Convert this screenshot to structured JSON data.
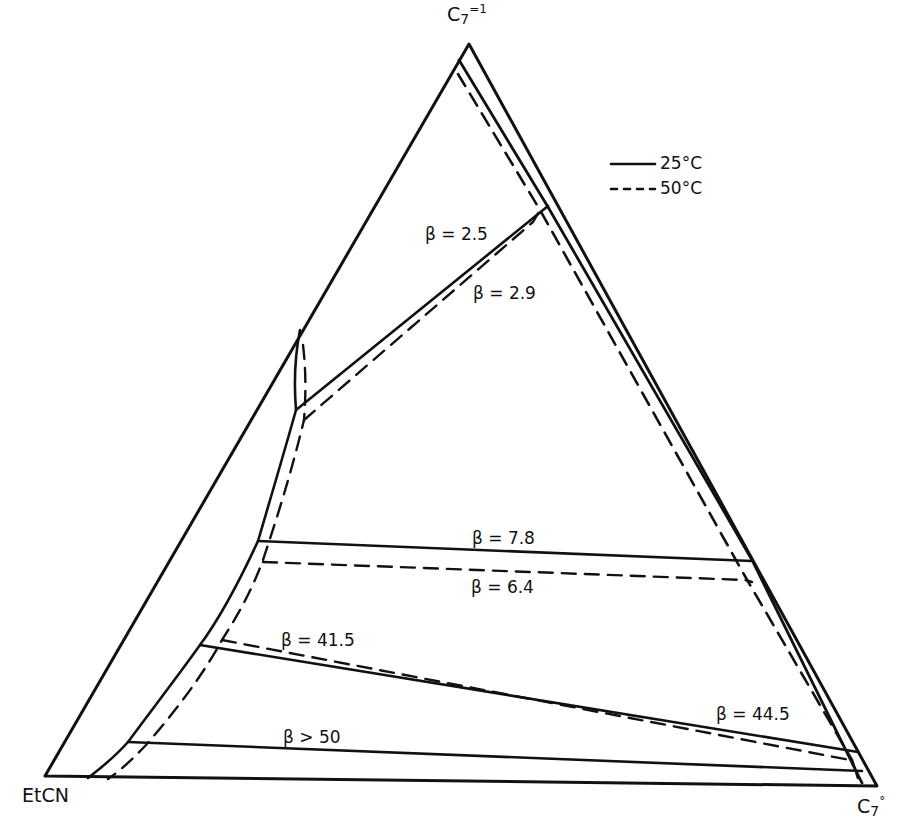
{
  "figure": {
    "type": "ternary phase diagram",
    "vertices": {
      "top": {
        "base": "C",
        "sub": "7",
        "sup": "=1",
        "display": "C7=1"
      },
      "left": {
        "label": "EtCN"
      },
      "right": {
        "base": "C",
        "sub": "7",
        "sup": "°",
        "display": "C7°"
      }
    },
    "legend": [
      {
        "label": "25°C",
        "style": "solid"
      },
      {
        "label": "50°C",
        "style": "dashed"
      }
    ],
    "tie_lines": [
      {
        "label": "β = 2.5",
        "temperature": "50°C",
        "style": "dashed"
      },
      {
        "label": "β = 2.9",
        "temperature": "25°C",
        "style": "solid"
      },
      {
        "label": "β = 7.8",
        "temperature": "25°C",
        "style": "solid"
      },
      {
        "label": "β = 6.4",
        "temperature": "50°C",
        "style": "dashed"
      },
      {
        "label": "β = 41.5",
        "temperature": "50°C",
        "style": "dashed"
      },
      {
        "label": "β = 44.5",
        "temperature": "25°C",
        "style": "solid"
      },
      {
        "label": "β > 50",
        "temperature": "25°C",
        "style": "solid"
      }
    ],
    "colors": {
      "ink": "#111111",
      "background": "#ffffff"
    }
  }
}
